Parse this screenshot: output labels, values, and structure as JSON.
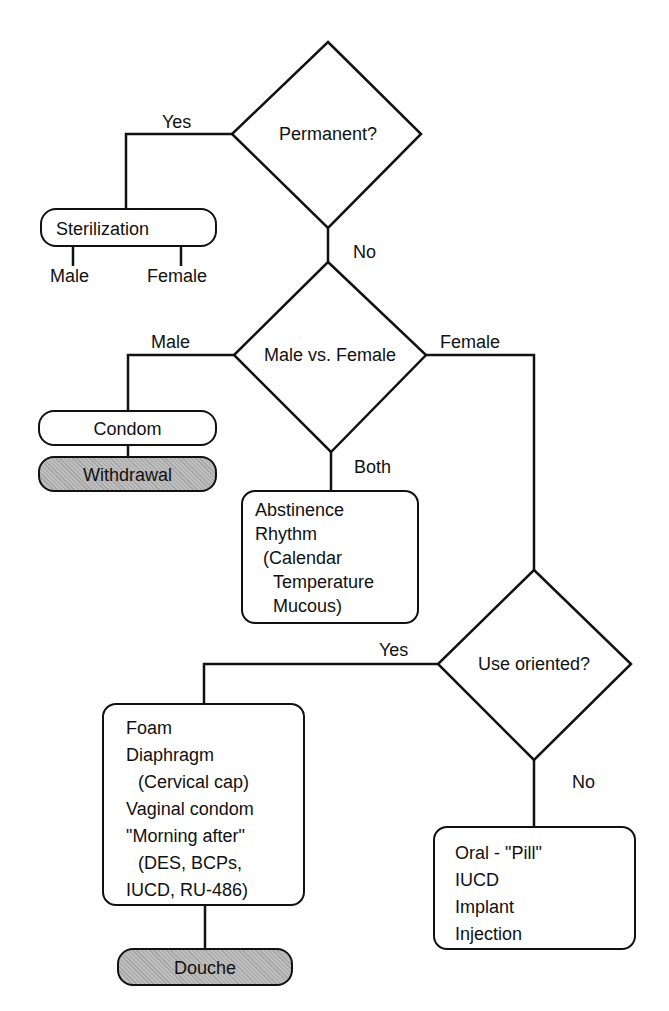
{
  "diagram": {
    "type": "flowchart",
    "decisions": {
      "permanent": {
        "label": "Permanent?",
        "yes_label": "Yes",
        "no_label": "No"
      },
      "sex": {
        "label": "Male vs. Female",
        "male_label": "Male",
        "female_label": "Female",
        "both_label": "Both"
      },
      "use_oriented": {
        "label": "Use oriented?",
        "yes_label": "Yes",
        "no_label": "No"
      }
    },
    "nodes": {
      "sterilization": {
        "label": "Sterilization",
        "sub": [
          "Male",
          "Female"
        ]
      },
      "condom": {
        "label": "Condom"
      },
      "withdrawal": {
        "label": "Withdrawal",
        "shaded": true
      },
      "both_methods": {
        "lines": [
          "Abstinence",
          "Rhythm",
          "(Calendar",
          "Temperature",
          "Mucous)"
        ]
      },
      "use_methods": {
        "lines": [
          "Foam",
          "Diaphragm",
          "(Cervical cap)",
          "Vaginal condom",
          "\"Morning after\"",
          "(DES, BCPs,",
          "IUCD, RU-486)"
        ]
      },
      "douche": {
        "label": "Douche",
        "shaded": true
      },
      "non_use_methods": {
        "lines": [
          "Oral - \"Pill\"",
          "IUCD",
          "Implant",
          "Injection"
        ]
      }
    }
  }
}
